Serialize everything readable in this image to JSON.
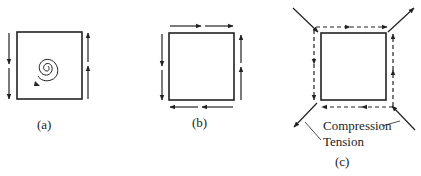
{
  "diagram": {
    "panels": [
      {
        "id": "a",
        "label": "(a)",
        "description": "Square element with opposing vertical shear forces and a rotation spiral"
      },
      {
        "id": "b",
        "label": "(b)",
        "description": "Square element with complementary shear forces on all four sides"
      },
      {
        "id": "c",
        "label": "(c)",
        "description": "Square element under pure shear with diagonal compression and tension"
      }
    ],
    "annotations": {
      "compression": "Compression",
      "tension": "Tension"
    },
    "colors": {
      "stroke": "#222222",
      "background": "#ffffff"
    }
  }
}
